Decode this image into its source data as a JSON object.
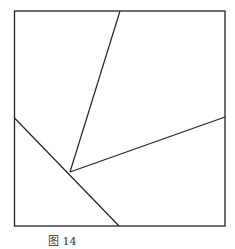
{
  "figure": {
    "caption": "图 14",
    "square": {
      "x1": 14,
      "y1": 11,
      "x2": 225,
      "y2": 226
    },
    "interior_point": {
      "x": 70,
      "y": 172
    },
    "segments": [
      {
        "name": "to-top",
        "from": [
          70,
          172
        ],
        "to": [
          120,
          11
        ]
      },
      {
        "name": "to-right",
        "from": [
          70,
          172
        ],
        "to": [
          225,
          117
        ]
      },
      {
        "name": "left-to-bottom",
        "from": [
          14,
          118
        ],
        "to": [
          119,
          226
        ]
      }
    ],
    "stroke_color": "#222222"
  }
}
